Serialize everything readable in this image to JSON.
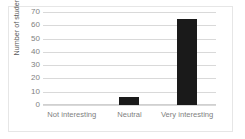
{
  "chart_data": {
    "type": "bar",
    "title": "",
    "xlabel": "",
    "ylabel": "Number of students",
    "categories": [
      "Not interesting",
      "Neutral",
      "Very interesting"
    ],
    "values": [
      0,
      6,
      65
    ],
    "ylim": [
      0,
      70
    ],
    "yticks": [
      0,
      10,
      20,
      30,
      40,
      50,
      60,
      70
    ],
    "ytick_labels": [
      "0",
      "10",
      "20",
      "30",
      "40",
      "50",
      "60",
      "70"
    ],
    "grid": true,
    "legend": false,
    "colors": {
      "bar": "#1a1a1a",
      "gridline": "#d9d9d9",
      "axis_text": "#7f7f7f",
      "axis_title": "#595959",
      "frame": "#e6e6e6",
      "background": "#ffffff"
    }
  }
}
